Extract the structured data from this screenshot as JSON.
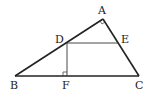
{
  "diagram": {
    "type": "geometry",
    "points": {
      "A": {
        "label": "A",
        "x": 103,
        "y": 19
      },
      "B": {
        "label": "B",
        "x": 15,
        "y": 76
      },
      "C": {
        "label": "C",
        "x": 139,
        "y": 76
      },
      "D": {
        "label": "D",
        "x": 67,
        "y": 43
      },
      "E": {
        "label": "E",
        "x": 119,
        "y": 43
      },
      "F": {
        "label": "F",
        "x": 67,
        "y": 76
      }
    },
    "segments": [
      "AB",
      "AC",
      "BC",
      "DE",
      "DF"
    ],
    "right_angles": [
      "A",
      "F"
    ],
    "colors": {
      "stroke": "#222222",
      "background": "#ffffff"
    }
  }
}
